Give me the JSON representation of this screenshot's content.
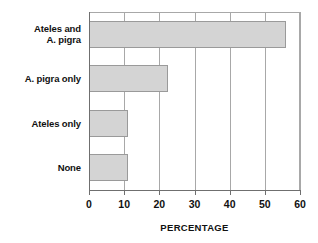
{
  "chart_data": {
    "type": "bar",
    "orientation": "horizontal",
    "title": "",
    "xlabel": "PERCENTAGE",
    "ylabel": "",
    "categories": [
      "Ateles and\nA. pigra",
      "A. pigra only",
      "Ateles only",
      "None"
    ],
    "values": [
      56,
      22.5,
      11,
      11
    ],
    "xlim": [
      0,
      60
    ],
    "xticks": [
      0,
      10,
      20,
      30,
      40,
      50,
      60
    ],
    "xtick_labels": [
      "0",
      "10",
      "20",
      "30",
      "40",
      "50",
      "60"
    ],
    "grid": "vertical",
    "legend": "none",
    "bar_fill_color": "#d4d4d4",
    "bar_border_color": "#9a9a9a",
    "axis_color": "#6f6f6f",
    "gridline_color": "#a8a8a8",
    "text_color": "#111111"
  }
}
